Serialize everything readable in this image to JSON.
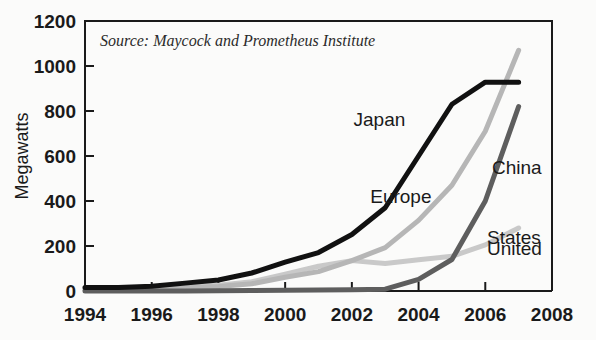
{
  "chart_data": {
    "type": "line",
    "title": "",
    "subtitle": "",
    "source_note": "Source: Maycock and Prometheus Institute",
    "xlabel": "",
    "ylabel": "Megawatts",
    "xlim": [
      1994,
      2008
    ],
    "ylim": [
      0,
      1200
    ],
    "grid": false,
    "legend_position": "inline-annotations",
    "x_ticks": [
      "1994",
      "1996",
      "1998",
      "2000",
      "2002",
      "2004",
      "2006",
      "2008"
    ],
    "x_tick_values": [
      1994,
      1996,
      1998,
      2000,
      2002,
      2004,
      2006,
      2008
    ],
    "y_ticks": [
      "0",
      "200",
      "400",
      "600",
      "800",
      "1000",
      "1200"
    ],
    "y_tick_values": [
      0,
      200,
      400,
      600,
      800,
      1000,
      1200
    ],
    "x": [
      1994,
      1995,
      1996,
      1997,
      1998,
      1999,
      2000,
      2001,
      2002,
      2003,
      2004,
      2005,
      2006,
      2007
    ],
    "series": [
      {
        "name": "Japan",
        "color": "#111111",
        "width": 5,
        "label_x": 2002.05,
        "label_y": 760,
        "values": [
          16,
          16,
          21,
          35,
          49,
          80,
          128,
          171,
          251,
          370,
          600,
          830,
          928,
          928
        ]
      },
      {
        "name": "Europe",
        "color": "#b6b6b6",
        "width": 5,
        "label_x": 2002.55,
        "label_y": 420,
        "values": [
          5,
          7,
          9,
          14,
          20,
          32,
          61,
          86,
          135,
          193,
          314,
          470,
          710,
          1070
        ]
      },
      {
        "name": "China",
        "color": "#5e5e5e",
        "width": 5,
        "label_x": 2006.2,
        "label_y": 545,
        "values": [
          0,
          0,
          0,
          0,
          1,
          2,
          3,
          4,
          6,
          8,
          52,
          140,
          400,
          820
        ]
      },
      {
        "name": "United States",
        "color": "#c9c9c9",
        "width": 5,
        "label_x": 2006.05,
        "label_y": 235,
        "label_line2_y": 185,
        "values": [
          12,
          14,
          16,
          21,
          26,
          41,
          75,
          110,
          135,
          122,
          139,
          154,
          205,
          280
        ]
      }
    ],
    "series_label_lines": {
      "United States": [
        "United",
        "States"
      ]
    }
  }
}
